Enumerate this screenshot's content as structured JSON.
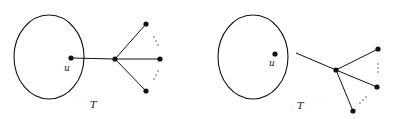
{
  "figure": {
    "left": {
      "region_label": "T",
      "vertex_label": "u"
    },
    "right": {
      "region_label": "T",
      "vertex_label": "u"
    },
    "colors": {
      "stroke": "#111111",
      "background": "#ffffff"
    }
  }
}
